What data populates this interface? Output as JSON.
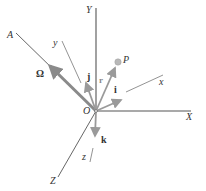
{
  "diagram": {
    "type": "3d-coordinate-frame",
    "colors": {
      "axis_line": "#555555",
      "thin_line": "#777777",
      "vector": "#9a9a9a",
      "omega_vector": "#8a8a8a",
      "point_fill": "#b8b8b8",
      "label": "#333333"
    },
    "fixed_axes": {
      "X": "X",
      "Y": "Y",
      "Z": "Z"
    },
    "rotating_axes": {
      "x": "x",
      "y": "y",
      "z": "z"
    },
    "axis_of_rotation": "A",
    "origin": "O",
    "point": "P",
    "vectors": {
      "omega": "Ω",
      "i": "i",
      "j": "j",
      "k": "k",
      "r": "r"
    }
  }
}
